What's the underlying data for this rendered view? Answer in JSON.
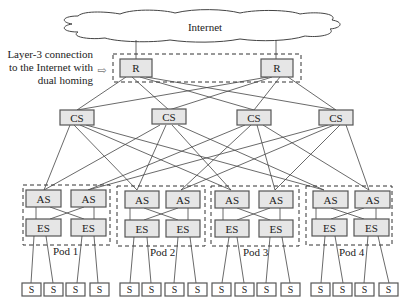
{
  "diagram": {
    "cloud": {
      "label": "Internet"
    },
    "annotation": {
      "lines": [
        "Layer-3 connection",
        "to the Internet with",
        "dual homing"
      ],
      "arrow": "⇨"
    },
    "routers": [
      {
        "id": "R1",
        "label": "R"
      },
      {
        "id": "R2",
        "label": "R"
      }
    ],
    "core_switches": [
      {
        "id": "CS1",
        "label": "CS"
      },
      {
        "id": "CS2",
        "label": "CS"
      },
      {
        "id": "CS3",
        "label": "CS"
      },
      {
        "id": "CS4",
        "label": "CS"
      }
    ],
    "pods": [
      {
        "label": "Pod 1",
        "aggregation": [
          "AS",
          "AS"
        ],
        "edge": [
          "ES",
          "ES"
        ],
        "servers": [
          "S",
          "S",
          "S",
          "S"
        ]
      },
      {
        "label": "Pod 2",
        "aggregation": [
          "AS",
          "AS"
        ],
        "edge": [
          "ES",
          "ES"
        ],
        "servers": [
          "S",
          "S",
          "S",
          "S"
        ]
      },
      {
        "label": "Pod 3",
        "aggregation": [
          "AS",
          "AS"
        ],
        "edge": [
          "ES",
          "ES"
        ],
        "servers": [
          "S",
          "S",
          "S",
          "S"
        ]
      },
      {
        "label": "Pod 4",
        "aggregation": [
          "AS",
          "AS"
        ],
        "edge": [
          "ES",
          "ES"
        ],
        "servers": [
          "S",
          "S",
          "S",
          "S"
        ]
      }
    ]
  }
}
